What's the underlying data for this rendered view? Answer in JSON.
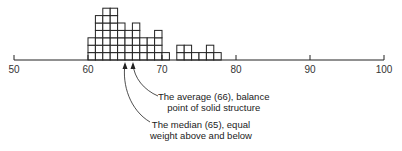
{
  "chart_data": {
    "type": "bar",
    "subtype": "dot-histogram (stacked unit squares)",
    "title": "",
    "xlabel": "",
    "ylabel": "",
    "xlim": [
      50,
      100
    ],
    "x_ticks": [
      50,
      60,
      70,
      80,
      90,
      100
    ],
    "bin_width": 1,
    "note": "Column heights are estimated from pixels and are approximate (±1 per column); they were not reconciled with the printed median/average annotations.",
    "bins": [
      {
        "start": 60,
        "count": 3
      },
      {
        "start": 61,
        "count": 6
      },
      {
        "start": 62,
        "count": 7
      },
      {
        "start": 63,
        "count": 7
      },
      {
        "start": 64,
        "count": 5
      },
      {
        "start": 65,
        "count": 4
      },
      {
        "start": 66,
        "count": 5
      },
      {
        "start": 67,
        "count": 3
      },
      {
        "start": 68,
        "count": 3
      },
      {
        "start": 69,
        "count": 4
      },
      {
        "start": 70,
        "count": 1
      },
      {
        "start": 71,
        "count": 0
      },
      {
        "start": 72,
        "count": 2
      },
      {
        "start": 73,
        "count": 2
      },
      {
        "start": 74,
        "count": 1
      },
      {
        "start": 75,
        "count": 1
      },
      {
        "start": 76,
        "count": 2
      },
      {
        "start": 77,
        "count": 1
      }
    ],
    "annotations": [
      {
        "label": "average",
        "value": 66,
        "text": "The average (66), balance point of solid structure"
      },
      {
        "label": "median",
        "value": 65,
        "text": "The median (65), equal weight above and below"
      }
    ],
    "grid": false,
    "legend": "none"
  },
  "annotations": {
    "average": {
      "line1": "The average (66), balance",
      "line2": "point of solid structure"
    },
    "median": {
      "line1": "The median (65), equal",
      "line2": "weight above and below"
    }
  },
  "colors": {
    "stroke": "#222222",
    "fill": "#ffffff"
  }
}
